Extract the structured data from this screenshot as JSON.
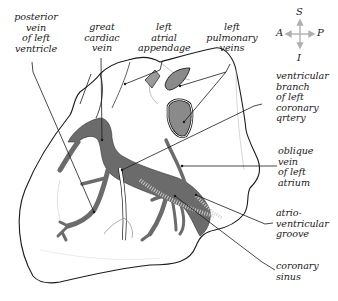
{
  "figure": {
    "colors": {
      "outline": "#1a1a1a",
      "vein_fill": "#6b6b6b",
      "vessel_stipple": "#9a9a9a",
      "background": "#ffffff",
      "compass_arrow": "#b0b0b0"
    }
  },
  "compass": {
    "superior": "S",
    "inferior": "I",
    "anterior": "A",
    "posterior": "P"
  },
  "labels": {
    "posterior_vein": "posterior\nvein\nof left\nventricle",
    "great_cardiac_vein": "great\ncardiac\nvein",
    "left_atrial_appendage": "left\natrial\nappendage",
    "left_pulmonary_veins": "left\npulmonary\nveins",
    "ventricular_branch": "ventricular\nbranch\nof left\ncoronary\nqrtery",
    "oblique_vein": "oblique\nvein\nof left\natrium",
    "av_groove": "atrio-\nventricular\ngroove",
    "coronary_sinus": "coronary\nsinus"
  }
}
